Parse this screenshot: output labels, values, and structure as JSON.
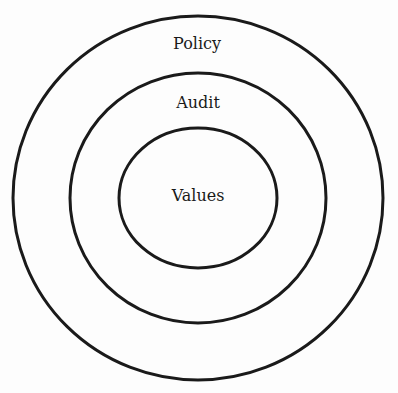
{
  "diagram": {
    "type": "concentric-circles",
    "stroke_color": "#1a1a1a",
    "background": "#fdfdfd",
    "rings": [
      {
        "label": "Policy",
        "level": "outer"
      },
      {
        "label": "Audit",
        "level": "middle"
      },
      {
        "label": "Values",
        "level": "inner"
      }
    ]
  }
}
